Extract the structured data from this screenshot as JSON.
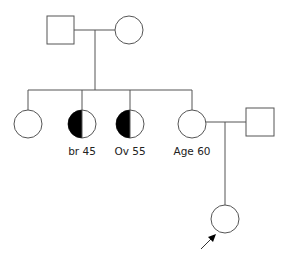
{
  "diagram": {
    "type": "pedigree",
    "colors": {
      "line": "#555555",
      "affected": "#000000",
      "background": "#ffffff"
    },
    "generations": [
      {
        "level": "I",
        "individuals": [
          {
            "id": "grandfather",
            "sex": "male",
            "affected": false,
            "label": ""
          },
          {
            "id": "grandmother",
            "sex": "female",
            "affected": false,
            "label": ""
          }
        ]
      },
      {
        "level": "II",
        "individuals": [
          {
            "id": "aunt-1",
            "sex": "female",
            "affected": false,
            "label": ""
          },
          {
            "id": "aunt-2",
            "sex": "female",
            "affected": "half",
            "label": "br 45"
          },
          {
            "id": "aunt-3",
            "sex": "female",
            "affected": "half",
            "label": "Ov 55"
          },
          {
            "id": "mother",
            "sex": "female",
            "affected": false,
            "label": "Age 60"
          },
          {
            "id": "father",
            "sex": "male",
            "affected": false,
            "label": ""
          }
        ]
      },
      {
        "level": "III",
        "individuals": [
          {
            "id": "proband",
            "sex": "female",
            "affected": false,
            "label": "",
            "proband": true
          }
        ]
      }
    ]
  }
}
